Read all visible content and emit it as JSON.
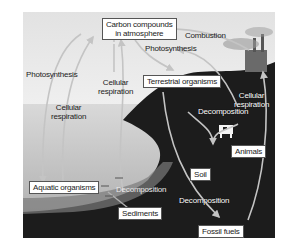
{
  "diagram": {
    "nodes": {
      "atmosphere": "Carbon compounds in atmosphere",
      "atmosphere_line1": "Carbon compounds",
      "atmosphere_line2": "in atmosphere",
      "terrestrial": "Terrestrial organisms",
      "aquatic": "Aquatic organisms",
      "animals": "Animals",
      "soil": "Soil",
      "sediments": "Sediments",
      "fossil_fuels": "Fossil fuels"
    },
    "process_labels": {
      "combustion": "Combustion",
      "photosynthesis_terrestrial": "Photosynthesis",
      "photosynthesis_aquatic": "Photosynthesis",
      "cellular_respiration_aquatic_line1": "Cellular",
      "cellular_respiration_aquatic_line2": "respiration",
      "cellular_respiration_mid_line1": "Cellular",
      "cellular_respiration_mid_line2": "respiration",
      "cellular_respiration_animals_line1": "Cellular",
      "cellular_respiration_animals_line2": "respiration",
      "decomposition_land": "Decomposition",
      "decomposition_water": "Decomposition",
      "decomposition_fossil": "Decomposition"
    },
    "edges": [
      {
        "from": "Aquatic organisms",
        "to": "Carbon compounds in atmosphere",
        "label": "Cellular respiration"
      },
      {
        "from": "Carbon compounds in atmosphere",
        "to": "Aquatic organisms",
        "label": "Photosynthesis"
      },
      {
        "from": "Carbon compounds in atmosphere",
        "to": "Terrestrial organisms",
        "label": "Photosynthesis"
      },
      {
        "from": "Terrestrial organisms",
        "to": "Carbon compounds in atmosphere",
        "label": "Cellular respiration"
      },
      {
        "from": "Fossil fuels",
        "to": "Carbon compounds in atmosphere",
        "label": "Combustion"
      },
      {
        "from": "Animals",
        "to": "Carbon compounds in atmosphere",
        "label": "Cellular respiration"
      },
      {
        "from": "Terrestrial organisms",
        "to": "Soil",
        "label": "Decomposition"
      },
      {
        "from": "Animals",
        "to": "Soil",
        "label": "Decomposition"
      },
      {
        "from": "Aquatic organisms",
        "to": "Sediments",
        "label": "Decomposition"
      },
      {
        "from": "Terrestrial organisms",
        "to": "Fossil fuels",
        "label": "Decomposition"
      }
    ],
    "colors": {
      "sky": "#eeeeee",
      "water": "#c8c8c8",
      "land": "#1e1e1e",
      "arrow": "#bdbdbd",
      "box_border": "#555555"
    }
  }
}
